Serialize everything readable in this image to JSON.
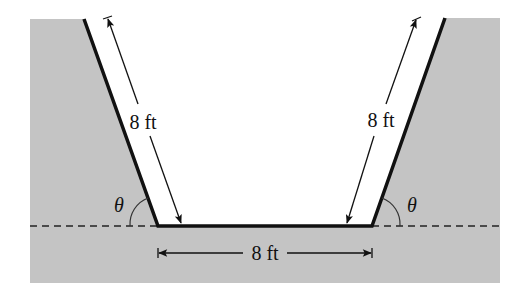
{
  "figure": {
    "colors": {
      "ground": "#c4c4c4",
      "channel": "#ffffff",
      "wall": "#111111",
      "dimension": "#111111"
    },
    "labels": {
      "left_side": "8 ft",
      "right_side": "8 ft",
      "bottom": "8 ft",
      "left_angle": "θ",
      "right_angle": "θ"
    }
  }
}
